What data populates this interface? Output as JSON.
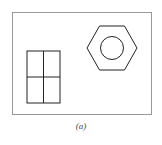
{
  "figure": {
    "caption": "(a)",
    "frame": {
      "x": 12.5,
      "y": 12.5,
      "width": 139,
      "height": 102,
      "stroke": "#999999"
    },
    "shapes": [
      {
        "type": "rectangle-grid",
        "name": "window-rectangle",
        "x": 27,
        "y": 51,
        "width": 33,
        "height": 52,
        "rows": 2,
        "cols": 2
      },
      {
        "type": "hexagon",
        "name": "hex-nut",
        "cx": 112,
        "cy": 48,
        "r": 25
      },
      {
        "type": "circle",
        "name": "nut-hole",
        "cx": 112,
        "cy": 48,
        "r": 11
      }
    ],
    "stroke_color": "#222222"
  }
}
